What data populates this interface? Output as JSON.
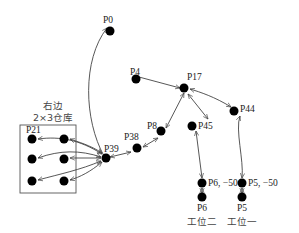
{
  "diagram": {
    "warehouse": {
      "title_line1": "右边",
      "title_line2": "2×3仓库",
      "corner_label": "P21"
    },
    "nodes": [
      {
        "id": "P0",
        "label": "P0"
      },
      {
        "id": "P4",
        "label": "P4"
      },
      {
        "id": "P17",
        "label": "P17"
      },
      {
        "id": "P8",
        "label": "P8"
      },
      {
        "id": "P45",
        "label": "P45"
      },
      {
        "id": "P44",
        "label": "P44"
      },
      {
        "id": "P38",
        "label": "P38"
      },
      {
        "id": "P39",
        "label": "P39"
      },
      {
        "id": "P6-50",
        "label": "P6, −50"
      },
      {
        "id": "P5-50",
        "label": "P5, −50"
      },
      {
        "id": "P6",
        "label": "P6"
      },
      {
        "id": "P5",
        "label": "P5"
      }
    ],
    "stations": {
      "station2": "工位二",
      "station1": "工位一"
    },
    "edges": [
      {
        "from": "P39",
        "to": "P0",
        "direction": "one-way"
      },
      {
        "from": "P4",
        "to": "P17",
        "direction": "one-way"
      },
      {
        "from": "P17",
        "to": "P8",
        "direction": "two-way"
      },
      {
        "from": "P8",
        "to": "P38",
        "direction": "two-way"
      },
      {
        "from": "P38",
        "to": "P39",
        "direction": "two-way"
      },
      {
        "from": "P17",
        "to": "P45",
        "direction": "two-way"
      },
      {
        "from": "P45",
        "to": "P6-50",
        "direction": "two-way"
      },
      {
        "from": "P44",
        "to": "P17",
        "direction": "two-way"
      },
      {
        "from": "P44",
        "to": "P5-50",
        "direction": "two-way"
      },
      {
        "from": "P6-50",
        "to": "P6",
        "direction": "two-way"
      },
      {
        "from": "P5-50",
        "to": "P5",
        "direction": "two-way"
      },
      {
        "from": "P39",
        "to": "W1",
        "direction": "two-way"
      },
      {
        "from": "P39",
        "to": "W2",
        "direction": "two-way"
      },
      {
        "from": "P39",
        "to": "W3",
        "direction": "two-way"
      },
      {
        "from": "P39",
        "to": "W4",
        "direction": "two-way"
      },
      {
        "from": "P39",
        "to": "W5",
        "direction": "two-way"
      },
      {
        "from": "P39",
        "to": "W6",
        "direction": "two-way"
      }
    ]
  }
}
